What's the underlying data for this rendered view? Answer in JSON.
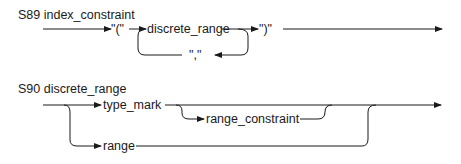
{
  "diagrams": [
    {
      "title": "S89 index_constraint",
      "elements": {
        "open_paren": "\"(\"",
        "discrete_range": "discrete_range",
        "comma": "\",\"",
        "close_paren": "\")\""
      }
    },
    {
      "title": "S90 discrete_range",
      "elements": {
        "type_mark": "type_mark",
        "range_constraint": "range_constraint",
        "range": "range"
      }
    }
  ],
  "colors": {
    "ink": "#1a1a1a",
    "background": "#ffffff"
  }
}
